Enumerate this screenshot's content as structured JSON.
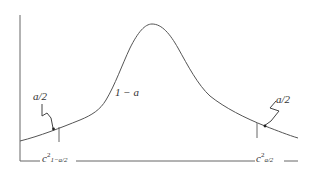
{
  "diagram": {
    "type": "probability-density-curve",
    "center_label": "1 − a",
    "left_tail": {
      "label": "a/2",
      "critical_value_base": "c",
      "critical_value_sup": "2",
      "critical_value_sub": "1−a/2"
    },
    "right_tail": {
      "label": "a/2",
      "critical_value_base": "c",
      "critical_value_sup": "2",
      "critical_value_sub": "a/2"
    },
    "colors": {
      "line": "#555555",
      "text": "#333333",
      "background": "#ffffff"
    }
  }
}
